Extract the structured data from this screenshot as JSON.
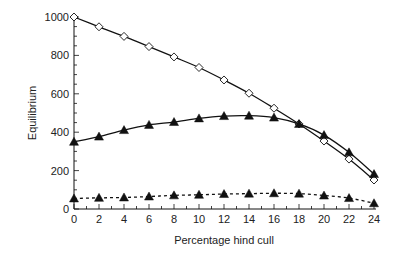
{
  "chart_data": {
    "type": "line",
    "title": "",
    "xlabel": "Percentage hind cull",
    "ylabel": "Equilibrium",
    "x": [
      0,
      2,
      4,
      6,
      8,
      10,
      12,
      14,
      16,
      18,
      20,
      22,
      24
    ],
    "xlim": [
      0,
      24
    ],
    "ylim": [
      0,
      1000
    ],
    "xticks": [
      0,
      2,
      4,
      6,
      8,
      10,
      12,
      14,
      16,
      18,
      20,
      22,
      24
    ],
    "yticks": [
      0,
      200,
      400,
      600,
      800,
      1000
    ],
    "grid": false,
    "legend": null,
    "series": [
      {
        "name": "open-diamond-solid",
        "marker": "open-diamond",
        "line": "solid",
        "values": [
          1000,
          949,
          899,
          846,
          792,
          737,
          672,
          603,
          525,
          443,
          354,
          260,
          151
        ]
      },
      {
        "name": "filled-triangle-solid",
        "marker": "filled-triangle",
        "line": "solid",
        "values": [
          350,
          377,
          411,
          438,
          453,
          472,
          484,
          486,
          476,
          443,
          385,
          295,
          182
        ]
      },
      {
        "name": "filled-triangle-dashed",
        "marker": "filled-triangle",
        "line": "dashed",
        "values": [
          55,
          58,
          60,
          65,
          71,
          74,
          78,
          80,
          82,
          80,
          70,
          57,
          30
        ]
      }
    ]
  },
  "colors": {
    "ink": "#111111",
    "background": "#ffffff"
  }
}
